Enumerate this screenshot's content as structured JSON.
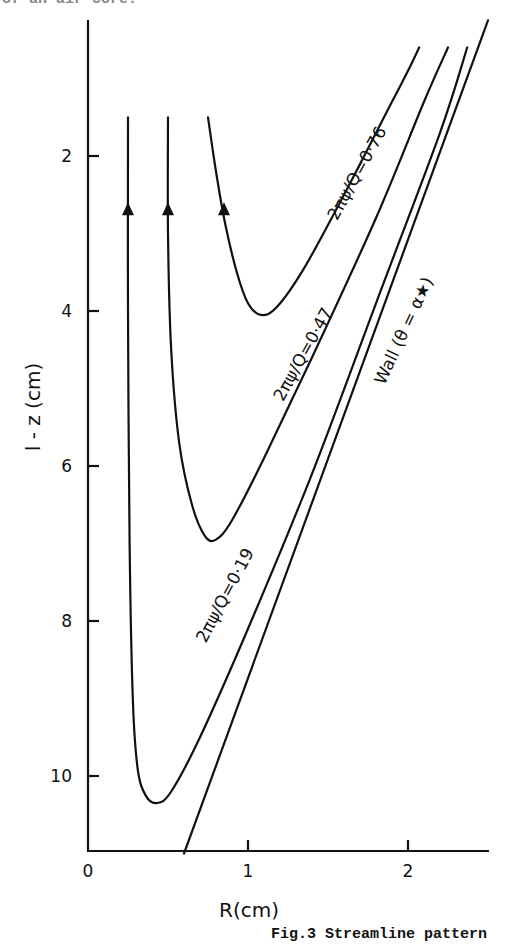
{
  "page": {
    "top_cropped_text": "of an air core.",
    "caption": "Fig.3 Streamline pattern"
  },
  "chart_data": {
    "type": "line",
    "title": "Streamline pattern",
    "caption": "Fig.3 Streamline pattern",
    "xlabel": "R(cm)",
    "ylabel": "l - z (cm)",
    "xlim": [
      0,
      2.5
    ],
    "ylim": [
      11,
      0.3
    ],
    "y_inverted": true,
    "grid": false,
    "x_ticks": [
      0,
      1,
      2
    ],
    "y_ticks": [
      2,
      4,
      6,
      8,
      10
    ],
    "legend": null,
    "series": [
      {
        "name": "2πψ/Q = 0·76",
        "label": "2πψ/Q=0·76",
        "arrow": {
          "R": 0.85,
          "z": 2.7,
          "direction": "up"
        },
        "points": [
          [
            0.75,
            1.5
          ],
          [
            0.8,
            2.2
          ],
          [
            0.86,
            2.9
          ],
          [
            0.93,
            3.5
          ],
          [
            1.0,
            3.9
          ],
          [
            1.08,
            4.05
          ],
          [
            1.18,
            3.95
          ],
          [
            1.35,
            3.45
          ],
          [
            1.6,
            2.5
          ],
          [
            1.9,
            1.3
          ],
          [
            2.0,
            0.9
          ],
          [
            2.07,
            0.6
          ]
        ]
      },
      {
        "name": "2πψ/Q = 0·47",
        "label": "2πψ/Q=0·47",
        "arrow": {
          "R": 0.5,
          "z": 2.7,
          "direction": "up"
        },
        "points": [
          [
            0.5,
            1.5
          ],
          [
            0.5,
            3.0
          ],
          [
            0.52,
            4.5
          ],
          [
            0.57,
            5.7
          ],
          [
            0.65,
            6.5
          ],
          [
            0.73,
            6.9
          ],
          [
            0.8,
            6.95
          ],
          [
            0.9,
            6.7
          ],
          [
            1.1,
            5.9
          ],
          [
            1.4,
            4.6
          ],
          [
            1.8,
            2.8
          ],
          [
            2.1,
            1.3
          ],
          [
            2.25,
            0.6
          ]
        ]
      },
      {
        "name": "2πψ/Q = 0·19",
        "label": "2πψ/Q=0·19",
        "arrow": {
          "R": 0.25,
          "z": 2.7,
          "direction": "up"
        },
        "points": [
          [
            0.25,
            1.5
          ],
          [
            0.25,
            4.0
          ],
          [
            0.26,
            7.0
          ],
          [
            0.28,
            9.0
          ],
          [
            0.31,
            9.9
          ],
          [
            0.36,
            10.25
          ],
          [
            0.43,
            10.35
          ],
          [
            0.52,
            10.2
          ],
          [
            0.7,
            9.5
          ],
          [
            1.0,
            8.1
          ],
          [
            1.4,
            6.1
          ],
          [
            1.8,
            3.9
          ],
          [
            2.2,
            1.7
          ],
          [
            2.37,
            0.6
          ]
        ]
      },
      {
        "name": "Wall (θ = α*)",
        "label": "Wall (θ = α★)",
        "points": [
          [
            0.6,
            11.0
          ],
          [
            2.5,
            0.25
          ]
        ]
      }
    ]
  }
}
